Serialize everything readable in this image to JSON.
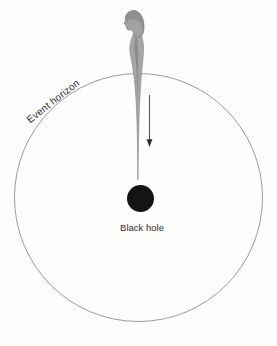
{
  "diagram": {
    "labels": {
      "event_horizon": "Event horizon",
      "black_hole": "Black hole"
    },
    "icons": {
      "down_arrow": "↓",
      "falling_person": "person-figure-stretched-toward-black-hole"
    },
    "colors": {
      "background": "#fdfdfc",
      "event_horizon_line": "#909090",
      "black_hole_fill": "#141414",
      "figure_gray": "#a6a6a6",
      "figure_shade": "#878787",
      "hair_gray": "#8d8d8d",
      "arrow": "#3f3f3f",
      "label_text": "#2f2f2f"
    }
  }
}
